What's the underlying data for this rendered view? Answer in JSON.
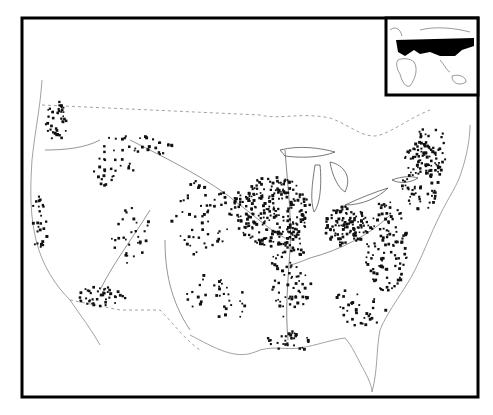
{
  "map": {
    "type": "dot-distribution",
    "region": "Contiguous United States",
    "colors": {
      "background": "#ffffff",
      "ink": "#111111",
      "frame": "#000000",
      "faint": "#9a9a9a",
      "inset_fill": "#000000"
    },
    "frame": {
      "x": 22,
      "y": 18,
      "w": 456,
      "h": 379,
      "stroke": 3
    },
    "inset": {
      "x": 386,
      "y": 18,
      "w": 92,
      "h": 77,
      "label": "",
      "highlighted_region": "Eurasia (Europe and Russia)"
    },
    "dot_clusters": [
      {
        "name": "pacific-northwest",
        "cx": 55,
        "cy": 120,
        "rx": 12,
        "ry": 20,
        "n": 40
      },
      {
        "name": "california-coast",
        "cx": 40,
        "cy": 220,
        "rx": 10,
        "ry": 30,
        "n": 25
      },
      {
        "name": "snake-river",
        "cx": 110,
        "cy": 170,
        "rx": 25,
        "ry": 15,
        "n": 25
      },
      {
        "name": "montana",
        "cx": 135,
        "cy": 145,
        "rx": 40,
        "ry": 12,
        "n": 30
      },
      {
        "name": "colorado",
        "cx": 130,
        "cy": 235,
        "rx": 20,
        "ry": 30,
        "n": 30
      },
      {
        "name": "arizona",
        "cx": 100,
        "cy": 295,
        "rx": 25,
        "ry": 10,
        "n": 45
      },
      {
        "name": "plains",
        "cx": 200,
        "cy": 215,
        "rx": 30,
        "ry": 40,
        "n": 55
      },
      {
        "name": "midwest-core",
        "cx": 270,
        "cy": 210,
        "rx": 40,
        "ry": 35,
        "n": 260
      },
      {
        "name": "ohio-indiana",
        "cx": 345,
        "cy": 225,
        "rx": 22,
        "ry": 20,
        "n": 120
      },
      {
        "name": "mississippi-valley",
        "cx": 290,
        "cy": 275,
        "rx": 20,
        "ry": 45,
        "n": 90
      },
      {
        "name": "appalachia",
        "cx": 385,
        "cy": 245,
        "rx": 22,
        "ry": 45,
        "n": 110
      },
      {
        "name": "northeast",
        "cx": 420,
        "cy": 175,
        "rx": 20,
        "ry": 35,
        "n": 90
      },
      {
        "name": "new-england",
        "cx": 430,
        "cy": 150,
        "rx": 18,
        "ry": 25,
        "n": 50
      },
      {
        "name": "gulf-coast",
        "cx": 290,
        "cy": 340,
        "rx": 25,
        "ry": 10,
        "n": 30
      },
      {
        "name": "texas",
        "cx": 215,
        "cy": 300,
        "rx": 30,
        "ry": 30,
        "n": 35
      },
      {
        "name": "southeast",
        "cx": 360,
        "cy": 305,
        "rx": 30,
        "ry": 20,
        "n": 35
      }
    ]
  }
}
